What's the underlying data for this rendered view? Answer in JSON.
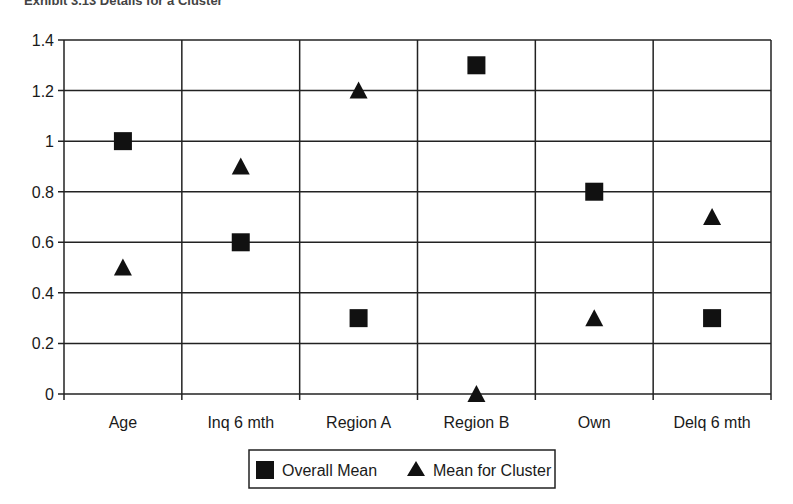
{
  "chart_data": {
    "type": "scatter",
    "title": "Exhibit 3.13 Details for a Cluster",
    "xlabel": "",
    "ylabel": "",
    "categories": [
      "Age",
      "Inq 6 mth",
      "Region A",
      "Region B",
      "Own",
      "Delq 6 mth"
    ],
    "series": [
      {
        "name": "Overall Mean",
        "marker": "square",
        "values": [
          1.0,
          0.6,
          0.3,
          1.3,
          0.8,
          0.3
        ]
      },
      {
        "name": "Mean for Cluster",
        "marker": "triangle",
        "values": [
          0.5,
          0.9,
          1.2,
          0.0,
          0.3,
          0.7
        ]
      }
    ],
    "ylim": [
      0,
      1.4
    ],
    "yticks": [
      "0",
      "0.2",
      "0.4",
      "0.6",
      "0.8",
      "1",
      "1.2",
      "1.4"
    ],
    "grid": true,
    "legend_position": "bottom"
  },
  "colors": {
    "marker": "#111111",
    "grid": "#222222",
    "background": "#ffffff"
  }
}
